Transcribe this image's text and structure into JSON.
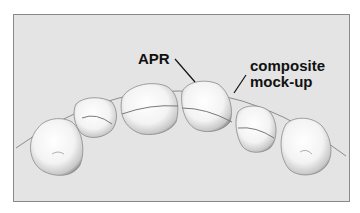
{
  "figure": {
    "labels": {
      "apr": "APR",
      "composite_line1": "composite",
      "composite_line2": "mock-up"
    },
    "colors": {
      "background": "#e4e4e4",
      "frame_border": "#8a8a8a",
      "arc_line": "#8c8c8c",
      "tooth_fill": "#f7f7f7",
      "tooth_shadow": "#9a9a9a",
      "text": "#111111"
    },
    "teeth": [
      {
        "name": "right-canine",
        "position": "left-most"
      },
      {
        "name": "right-lateral-incisor",
        "position": "left-2"
      },
      {
        "name": "right-central-incisor",
        "position": "left-3"
      },
      {
        "name": "left-central-incisor",
        "position": "right-3"
      },
      {
        "name": "left-lateral-incisor",
        "position": "right-2"
      },
      {
        "name": "left-canine",
        "position": "right-most"
      }
    ]
  }
}
